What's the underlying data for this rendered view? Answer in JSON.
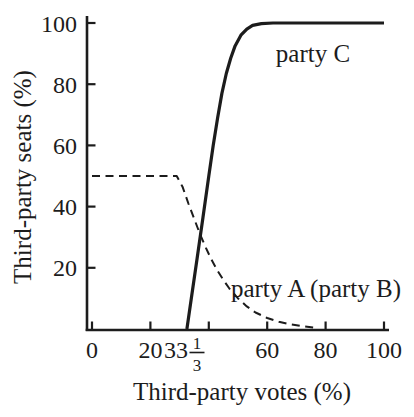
{
  "canvas": {
    "background": "#ffffff",
    "ink_color": "#1c1c1c"
  },
  "chart_data": {
    "type": "line",
    "title": "",
    "xlabel": "Third-party votes (%)",
    "ylabel": "Third-party seats (%)",
    "xlim": [
      0,
      100
    ],
    "ylim": [
      0,
      100
    ],
    "grid": false,
    "legend_position": "inline-labels",
    "x_ticks": [
      {
        "value": 0,
        "label": "0"
      },
      {
        "value": 20,
        "label": "20"
      },
      {
        "value": 40,
        "label": ""
      },
      {
        "value": 60,
        "label": "60"
      },
      {
        "value": 80,
        "label": "80"
      },
      {
        "value": 100,
        "label": "100"
      }
    ],
    "x_fraction_label": {
      "value": 33.333,
      "whole": "33",
      "numerator": "1",
      "denominator": "3"
    },
    "y_ticks": [
      {
        "value": 20,
        "label": "20"
      },
      {
        "value": 40,
        "label": "40"
      },
      {
        "value": 60,
        "label": "60"
      },
      {
        "value": 80,
        "label": "80"
      },
      {
        "value": 100,
        "label": "100"
      }
    ],
    "series": [
      {
        "name": "party C",
        "line_style": "solid",
        "color": "#1c1c1c",
        "points": [
          [
            32.5,
            0
          ],
          [
            34,
            10
          ],
          [
            36,
            23
          ],
          [
            38,
            36.5
          ],
          [
            40,
            50
          ],
          [
            41.5,
            60
          ],
          [
            43,
            69
          ],
          [
            44.5,
            77
          ],
          [
            46,
            83.5
          ],
          [
            47.5,
            88.5
          ],
          [
            49,
            92.5
          ],
          [
            51,
            96
          ],
          [
            53,
            98
          ],
          [
            55,
            99.2
          ],
          [
            58,
            99.8
          ],
          [
            62,
            100
          ],
          [
            100,
            100
          ]
        ]
      },
      {
        "name": "party A (party B)",
        "line_style": "dashed",
        "color": "#1c1c1c",
        "points": [
          [
            0,
            50
          ],
          [
            29,
            50
          ],
          [
            31,
            46.5
          ],
          [
            33,
            41
          ],
          [
            35,
            36
          ],
          [
            37,
            31
          ],
          [
            39,
            26.5
          ],
          [
            41,
            22.5
          ],
          [
            43,
            19
          ],
          [
            45,
            16
          ],
          [
            47,
            13.3
          ],
          [
            50,
            10
          ],
          [
            53,
            7.4
          ],
          [
            56,
            5.4
          ],
          [
            60,
            3.6
          ],
          [
            64,
            2.4
          ],
          [
            68,
            1.5
          ],
          [
            72,
            0.9
          ],
          [
            76,
            0.5
          ]
        ]
      }
    ]
  }
}
